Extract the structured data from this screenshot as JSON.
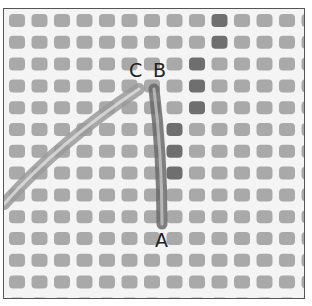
{
  "image": {
    "description": "Needlepoint canvas stitch diagram with yarn strands",
    "labels": [
      {
        "id": "C",
        "text": "C",
        "x": 128,
        "y": 60
      },
      {
        "id": "B",
        "text": "B",
        "x": 152,
        "y": 60
      },
      {
        "id": "A",
        "text": "A",
        "x": 154,
        "y": 225
      }
    ],
    "colors": {
      "canvas": "#f4f4f4",
      "hole": "#a9a9a9",
      "hole_dark": "#6f6f6f",
      "yarn": "#9a9a9a",
      "yarn_dark": "#6a6a6a",
      "border": "#555555"
    },
    "grid": {
      "cols": 14,
      "rows": 14,
      "pitch_x": 22.5,
      "pitch_y": 21.8,
      "offset_x": 5,
      "offset_y": 5,
      "hole_w": 16,
      "hole_h": 13
    },
    "dark_holes": [
      [
        9,
        0
      ],
      [
        9,
        1
      ],
      [
        8,
        2
      ],
      [
        8,
        3
      ],
      [
        8,
        4
      ],
      [
        7,
        5
      ],
      [
        7,
        6
      ],
      [
        7,
        7
      ]
    ]
  }
}
